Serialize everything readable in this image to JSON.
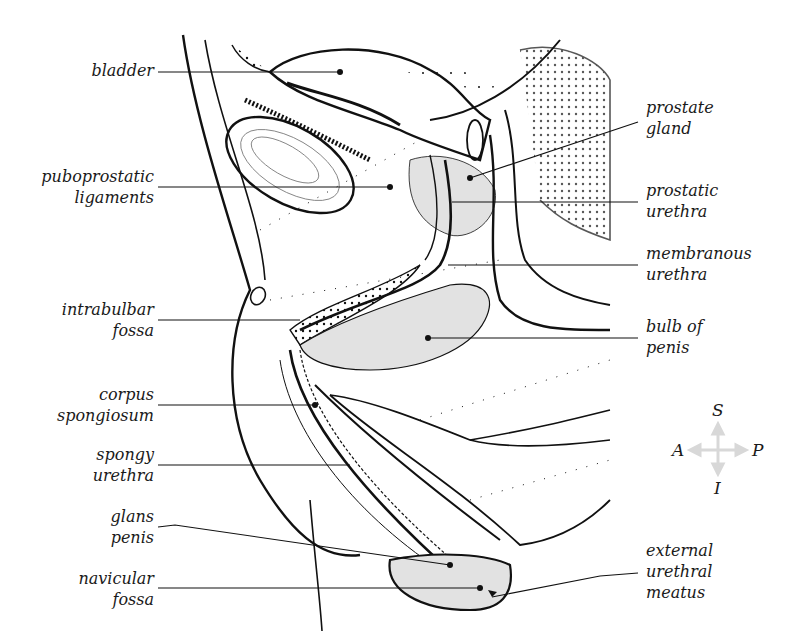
{
  "figure": {
    "type": "anatomical sagittal section",
    "colors": {
      "line": "#111111",
      "shade": "#e2e2e2",
      "compass_arrow": "#d8d8d8",
      "background": "#ffffff"
    }
  },
  "labels_left": [
    {
      "id": "bladder",
      "text": "bladder"
    },
    {
      "id": "puboprostatic-ligaments",
      "text": "puboprostatic\nligaments"
    },
    {
      "id": "intrabulbar-fossa",
      "text": "intrabulbar\nfossa"
    },
    {
      "id": "corpus-spongiosum",
      "text": "corpus\nspongiosum"
    },
    {
      "id": "spongy-urethra",
      "text": "spongy\nurethra"
    },
    {
      "id": "glans-penis",
      "text": "glans\npenis"
    },
    {
      "id": "navicular-fossa",
      "text": "navicular\nfossa"
    }
  ],
  "labels_right": [
    {
      "id": "prostate-gland",
      "text": "prostate\ngland"
    },
    {
      "id": "prostatic-urethra",
      "text": "prostatic\nurethra"
    },
    {
      "id": "membranous-urethra",
      "text": "membranous\nurethra"
    },
    {
      "id": "bulb-of-penis",
      "text": "bulb of\npenis"
    },
    {
      "id": "external-urethral-meatus",
      "text": "external\nurethral\nmeatus"
    }
  ],
  "compass": {
    "superior": "S",
    "inferior": "I",
    "anterior": "A",
    "posterior": "P"
  }
}
